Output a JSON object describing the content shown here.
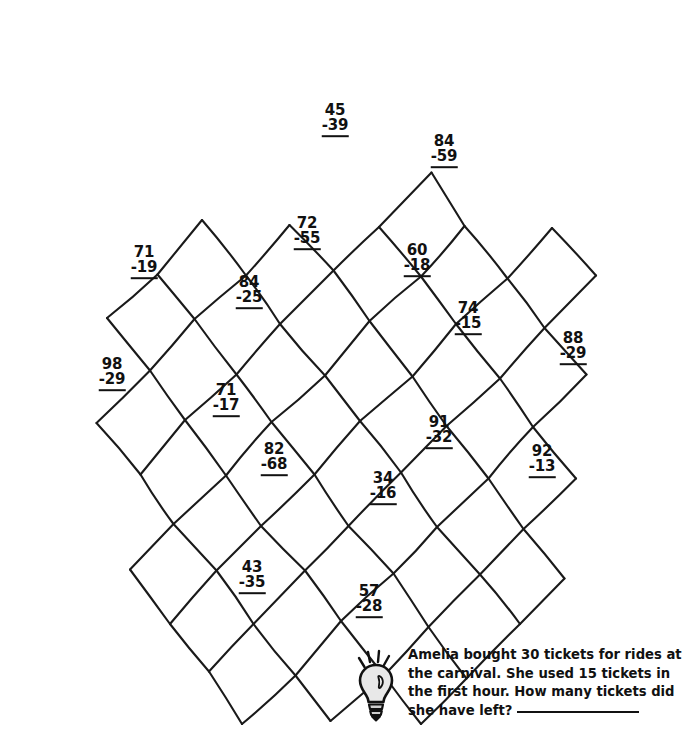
{
  "worksheet": {
    "type": "subtraction-puzzle",
    "ink_color": "#1a1a1a",
    "background": "#ffffff"
  },
  "problems": [
    {
      "id": "p1",
      "minuend": "45",
      "subtrahend": "-39",
      "x": 335,
      "y": 120
    },
    {
      "id": "p2",
      "minuend": "84",
      "subtrahend": "-59",
      "x": 444,
      "y": 151
    },
    {
      "id": "p3",
      "minuend": "71",
      "subtrahend": "-19",
      "x": 144,
      "y": 262
    },
    {
      "id": "p4",
      "minuend": "72",
      "subtrahend": "-55",
      "x": 307,
      "y": 233
    },
    {
      "id": "p5",
      "minuend": "60",
      "subtrahend": "-18",
      "x": 417,
      "y": 260
    },
    {
      "id": "p6",
      "minuend": "84",
      "subtrahend": "-25",
      "x": 249,
      "y": 292
    },
    {
      "id": "p7",
      "minuend": "74",
      "subtrahend": "-15",
      "x": 468,
      "y": 318
    },
    {
      "id": "p8",
      "minuend": "98",
      "subtrahend": "-29",
      "x": 112,
      "y": 374
    },
    {
      "id": "p9",
      "minuend": "88",
      "subtrahend": "-29",
      "x": 573,
      "y": 348
    },
    {
      "id": "p10",
      "minuend": "71",
      "subtrahend": "-17",
      "x": 226,
      "y": 400
    },
    {
      "id": "p11",
      "minuend": "91",
      "subtrahend": "-32",
      "x": 439,
      "y": 432
    },
    {
      "id": "p12",
      "minuend": "82",
      "subtrahend": "-68",
      "x": 274,
      "y": 459
    },
    {
      "id": "p13",
      "minuend": "92",
      "subtrahend": "-13",
      "x": 542,
      "y": 461
    },
    {
      "id": "p14",
      "minuend": "34",
      "subtrahend": "-16",
      "x": 383,
      "y": 488
    },
    {
      "id": "p15",
      "minuend": "43",
      "subtrahend": "-35",
      "x": 252,
      "y": 577
    },
    {
      "id": "p16",
      "minuend": "57",
      "subtrahend": "-28",
      "x": 369,
      "y": 601
    }
  ],
  "word_problem": {
    "icon": "lightbulb-icon",
    "line1": "Amelia bought 30 tickets for rides",
    "line2": "at the carnival. She used 15 tickets in",
    "line3": "the first hour. How many tickets did",
    "line4": "she have left?",
    "answer_value": ""
  },
  "lattice": {
    "stroke_width": 2.1,
    "rows": 8,
    "cols": 8,
    "origin_x": 399,
    "origin_y": 24,
    "u": {
      "x": -48.5,
      "y": 49.5
    },
    "v": {
      "x": 39.0,
      "y": 50.5
    },
    "jitter": [
      [
        0,
        0,
        2,
        -3,
        -2,
        2,
        3,
        1,
        -3,
        -2,
        1,
        3,
        -1,
        -3,
        2,
        2,
        -2,
        1
      ],
      [
        3,
        2,
        -2,
        3,
        1,
        -2,
        -3,
        2,
        2,
        3,
        -1,
        -3,
        3,
        -1,
        -2,
        2,
        1,
        3
      ],
      [
        -2,
        1,
        3,
        -2,
        -1,
        3,
        2,
        -3,
        -3,
        1,
        2,
        2,
        -1,
        -2,
        3,
        3,
        -2,
        -1
      ],
      [
        1,
        3,
        -3,
        1,
        2,
        2,
        -1,
        -3,
        3,
        2,
        -2,
        -1,
        1,
        3,
        -3,
        2,
        2,
        -2
      ],
      [
        -3,
        2,
        1,
        3,
        -2,
        -1,
        3,
        2,
        -1,
        -3,
        2,
        1,
        -3,
        3,
        1,
        -2,
        3,
        2
      ],
      [
        2,
        -1,
        -1,
        2,
        3,
        3,
        -2,
        1,
        1,
        -2,
        -3,
        2,
        2,
        -3,
        -1,
        1,
        3,
        -1
      ],
      [
        -1,
        3,
        2,
        -2,
        -3,
        1,
        1,
        3,
        -2,
        2,
        3,
        -1,
        -1,
        -3,
        2,
        2,
        -3,
        1
      ],
      [
        3,
        1,
        -2,
        -2,
        1,
        2,
        -3,
        3,
        2,
        -1,
        -1,
        2,
        3,
        1,
        -2,
        -3,
        1,
        2
      ],
      [
        -2,
        2,
        1,
        -3,
        2,
        1,
        -1,
        2,
        3,
        -2,
        -2,
        3,
        1,
        -1,
        3,
        2,
        -1,
        -2
      ]
    ],
    "blanks": [
      [
        0,
        0
      ],
      [
        0,
        1
      ],
      [
        0,
        2
      ],
      [
        0,
        3
      ],
      [
        0,
        6
      ],
      [
        0,
        7
      ],
      [
        1,
        0
      ],
      [
        1,
        1
      ],
      [
        1,
        2
      ],
      [
        1,
        7
      ],
      [
        2,
        0
      ],
      [
        2,
        7
      ],
      [
        3,
        0
      ],
      [
        5,
        0
      ],
      [
        6,
        0
      ],
      [
        6,
        1
      ],
      [
        6,
        7
      ],
      [
        7,
        0
      ],
      [
        7,
        1
      ],
      [
        7,
        2
      ],
      [
        7,
        6
      ],
      [
        7,
        7
      ]
    ]
  }
}
